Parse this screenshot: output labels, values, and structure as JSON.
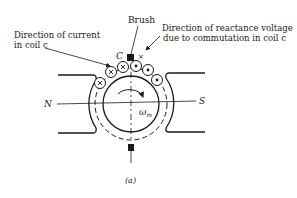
{
  "figure": {
    "caption": "(a)",
    "labels": {
      "brush": "Brush",
      "current_direction_line1": "Direction of current",
      "current_direction_line2": "in coil c",
      "reactance_line1": "Direction of reactance voltage",
      "reactance_line2": "due to commutation in coil c",
      "coil_label": "C",
      "commutation_mark": "×",
      "north_pole": "N",
      "south_pole": "S",
      "omega": "ω",
      "omega_sub": "m"
    },
    "conductors": [
      {
        "position": "left-1",
        "symbol": "cross"
      },
      {
        "position": "left-2",
        "symbol": "cross"
      },
      {
        "position": "left-3",
        "symbol": "cross"
      },
      {
        "position": "right-1",
        "symbol": "dot"
      },
      {
        "position": "right-2",
        "symbol": "dot"
      },
      {
        "position": "right-3",
        "symbol": "dot"
      }
    ],
    "colors": {
      "ink": "#1a1a1a",
      "background": "#ffffff"
    }
  }
}
